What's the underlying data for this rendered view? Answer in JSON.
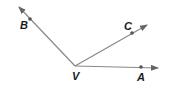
{
  "diagram": {
    "type": "angles",
    "vertex": {
      "label": "V",
      "x": 75,
      "y": 66,
      "label_x": 72,
      "label_y": 80
    },
    "rays": [
      {
        "name": "VB",
        "point_label": "B",
        "point": [
          30,
          19
        ],
        "tip": [
          19,
          7
        ],
        "label_pos": [
          20,
          29
        ]
      },
      {
        "name": "VC",
        "point_label": "C",
        "point": [
          132,
          33
        ],
        "tip": [
          147,
          25
        ],
        "label_pos": [
          124,
          29
        ]
      },
      {
        "name": "VA",
        "point_label": "A",
        "point": [
          141,
          67
        ],
        "tip": [
          158,
          68
        ],
        "label_pos": [
          137,
          81
        ]
      }
    ],
    "colors": {
      "ray": "#808080",
      "point": "#555555",
      "label": "#1a1a1a"
    }
  },
  "labels": {
    "v": "V",
    "b": "B",
    "c": "C",
    "a": "A"
  }
}
